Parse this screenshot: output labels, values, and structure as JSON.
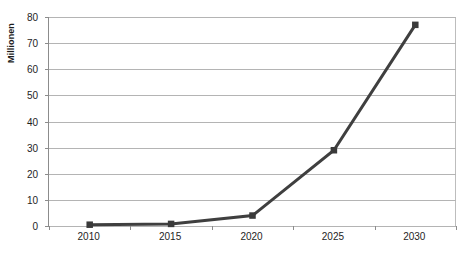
{
  "chart_data": {
    "type": "line",
    "title": "",
    "xlabel": "",
    "ylabel": "Millionen",
    "categories": [
      "2010",
      "2015",
      "2020",
      "2025",
      "2030"
    ],
    "x": [
      2010,
      2015,
      2020,
      2025,
      2030
    ],
    "values": [
      0.5,
      0.8,
      4,
      29,
      77
    ],
    "series": [
      {
        "name": "",
        "values": [
          0.5,
          0.8,
          4,
          29,
          77
        ]
      }
    ],
    "ylim": [
      0,
      80
    ],
    "yticks": [
      0,
      10,
      20,
      30,
      40,
      50,
      60,
      70,
      80
    ],
    "ytick_labels": [
      "0",
      "10",
      "20",
      "30",
      "40",
      "50",
      "60",
      "70",
      "80"
    ],
    "grid": true,
    "grid_axis": "y",
    "legend": false,
    "legend_position": "none",
    "marker": "square",
    "line_color": "#3f3f3f",
    "marker_color": "#3a3a3a",
    "gridline_color": "#b4b4b4",
    "axis_color": "#8c8c8c",
    "background_color": "#ffffff",
    "text_color": "#1e1e1e"
  }
}
